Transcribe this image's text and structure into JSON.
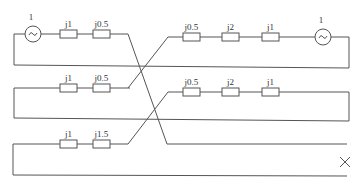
{
  "diagram": {
    "sources": [
      {
        "id": "source-left",
        "label": "1",
        "cx": 33,
        "cy": 34
      },
      {
        "id": "source-right",
        "label": "1",
        "cx": 323,
        "cy": 37
      }
    ],
    "impedances": [
      {
        "label": "j1",
        "x": 60,
        "y": 34
      },
      {
        "label": "j0.5",
        "x": 93,
        "y": 34
      },
      {
        "label": "j0.5",
        "x": 183,
        "y": 37
      },
      {
        "label": "j2",
        "x": 222,
        "y": 37
      },
      {
        "label": "j1",
        "x": 262,
        "y": 37
      },
      {
        "label": "j1",
        "x": 60,
        "y": 88
      },
      {
        "label": "j0.5",
        "x": 93,
        "y": 88
      },
      {
        "label": "j0.5",
        "x": 183,
        "y": 92
      },
      {
        "label": "j2",
        "x": 222,
        "y": 92
      },
      {
        "label": "j1",
        "x": 262,
        "y": 92
      },
      {
        "label": "j1",
        "x": 60,
        "y": 144
      },
      {
        "label": "j1.5",
        "x": 93,
        "y": 144
      }
    ],
    "fault_marker": {
      "symbol": "×",
      "x": 345,
      "y": 162
    },
    "colors": {
      "line": "#555555",
      "box_fill": "#ffffff"
    }
  }
}
